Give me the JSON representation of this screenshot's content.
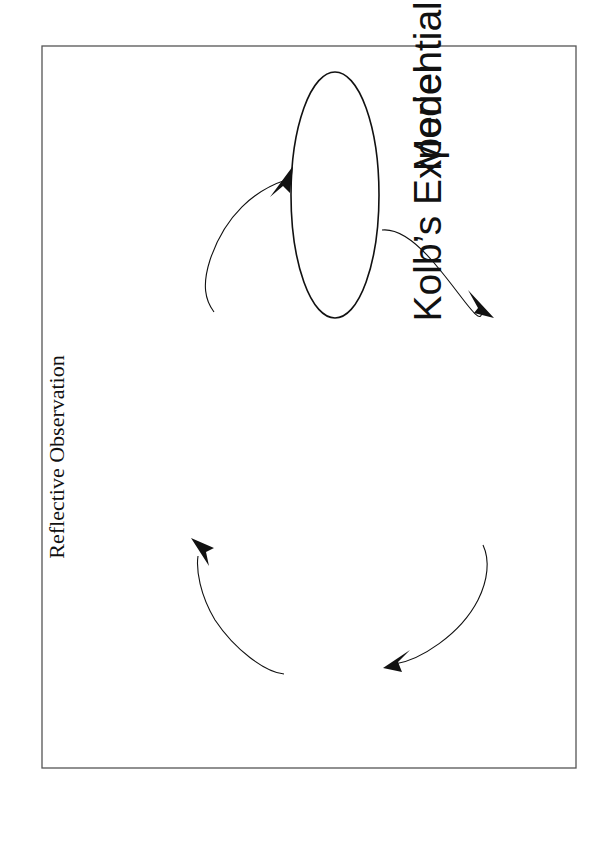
{
  "slide": {
    "title_line1": "Kolb’s Experiential Learning",
    "title_line2": "Model",
    "slide_id": "T3.0",
    "copyright": "© 2001 Prentice Hall, Inc.",
    "citation_line1": "Organizational Behavior: An Experiential Approach 7/E",
    "citation_line2": "Joyce S. Osland, David A. Kolb, and Irwin M. Rubin"
  },
  "cycle": {
    "nodes": [
      {
        "id": "concrete-experience",
        "line1": "Concrete Experience",
        "line2": "(exercises)",
        "line3": ""
      },
      {
        "id": "reflective-observation",
        "line1": "Reflective Observation",
        "line2": "(discussion)",
        "line3": ""
      },
      {
        "id": "abstract-conceptualization",
        "line1": "Abstract",
        "line2": "Conceptualization",
        "line3": "(reading)"
      },
      {
        "id": "active-experimentation",
        "line1": "Active Experimentation",
        "line2": "(personal application",
        "line3": "assignments)"
      }
    ],
    "flow": [
      "Concrete Experience → Reflective Observation",
      "Reflective Observation → Abstract Conceptualization",
      "Abstract Conceptualization → Active Experimentation",
      "Active Experimentation → Concrete Experience"
    ]
  },
  "colors": {
    "ink": "#111111",
    "frame": "#555555",
    "background": "#ffffff"
  }
}
